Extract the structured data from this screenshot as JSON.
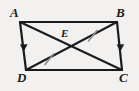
{
  "figure": {
    "kind": "parallelogram-with-diagonals",
    "background_color": "#f2f1ef",
    "stroke_color": "#1b1b1b",
    "tick_color": "#8c8c8c",
    "width": 139,
    "height": 91,
    "vertices": [
      {
        "name": "A",
        "label": "A",
        "x": 20,
        "y": 22
      },
      {
        "name": "B",
        "label": "B",
        "x": 117,
        "y": 22
      },
      {
        "name": "C",
        "label": "C",
        "x": 122,
        "y": 70
      },
      {
        "name": "D",
        "label": "D",
        "x": 26,
        "y": 70
      }
    ],
    "interior_points": [
      {
        "name": "E",
        "label": "E",
        "x": 71,
        "y": 46
      }
    ],
    "sides": [
      {
        "name": "AB",
        "from": "A",
        "to": "B",
        "marks": "none"
      },
      {
        "name": "BC",
        "from": "B",
        "to": "C",
        "marks": "single-arrow"
      },
      {
        "name": "DC",
        "from": "D",
        "to": "C",
        "marks": "none"
      },
      {
        "name": "AD",
        "from": "A",
        "to": "D",
        "marks": "single-arrow"
      }
    ],
    "diagonals": [
      {
        "name": "AC",
        "from": "A",
        "to": "C",
        "through": "E"
      },
      {
        "name": "BD",
        "from": "B",
        "to": "D",
        "through": "E"
      }
    ],
    "segment_marks": [
      {
        "name": "DE",
        "segment": "D-E",
        "marks": "single-tick"
      },
      {
        "name": "EB",
        "segment": "E-B",
        "marks": "single-tick"
      }
    ]
  }
}
